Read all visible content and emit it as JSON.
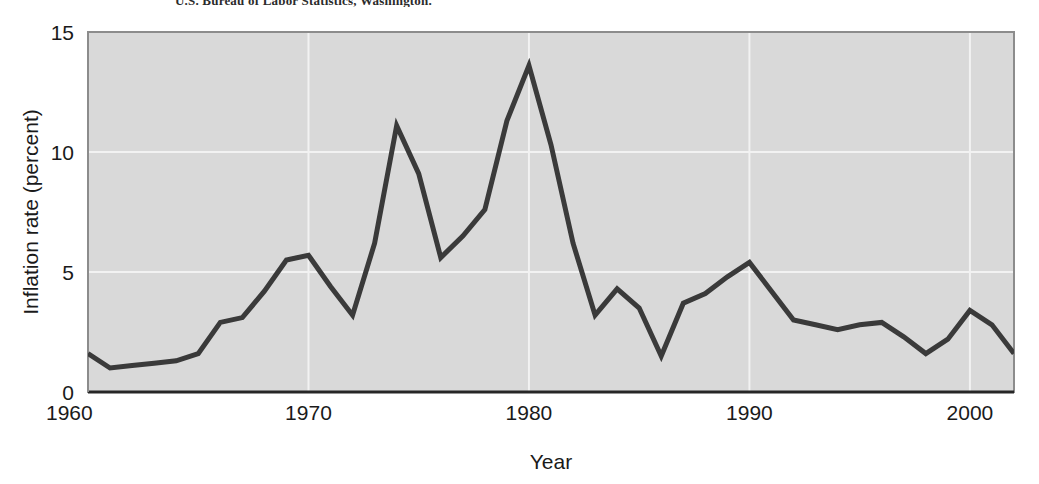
{
  "figure": {
    "source_credit": "U.S. Bureau of Labor Statistics, Washington."
  },
  "chart_data": {
    "type": "line",
    "title": "",
    "xlabel": "Year",
    "ylabel": "Inflation rate (percent)",
    "xlim": [
      1960,
      2002
    ],
    "ylim": [
      0,
      15
    ],
    "xticks": [
      1960,
      1970,
      1980,
      1990,
      2000
    ],
    "xtick_labels": [
      "1960",
      "1970",
      "1980",
      "1990",
      "2000"
    ],
    "yticks": [
      0,
      5,
      10,
      15
    ],
    "ytick_labels": [
      "0",
      "5",
      "10",
      "15"
    ],
    "grid": true,
    "grid_color": "#f2f2f2",
    "plot_background": "#d9d9d9",
    "line_color": "#3a3a3a",
    "line_width": 5,
    "legend": "none",
    "series": [
      {
        "name": "Inflation rate",
        "x": [
          1960,
          1961,
          1962,
          1963,
          1964,
          1965,
          1966,
          1967,
          1968,
          1969,
          1970,
          1971,
          1972,
          1973,
          1974,
          1975,
          1976,
          1977,
          1978,
          1979,
          1980,
          1981,
          1982,
          1983,
          1984,
          1985,
          1986,
          1987,
          1988,
          1989,
          1990,
          1991,
          1992,
          1993,
          1994,
          1995,
          1996,
          1997,
          1998,
          1999,
          2000,
          2001,
          2002
        ],
        "values": [
          1.6,
          1.0,
          1.1,
          1.2,
          1.3,
          1.6,
          2.9,
          3.1,
          4.2,
          5.5,
          5.7,
          4.4,
          3.2,
          6.2,
          11.1,
          9.1,
          5.6,
          6.5,
          7.6,
          11.3,
          13.6,
          10.3,
          6.2,
          3.2,
          4.3,
          3.5,
          1.5,
          3.7,
          4.1,
          4.8,
          5.4,
          4.2,
          3.0,
          2.8,
          2.6,
          2.8,
          2.9,
          2.3,
          1.6,
          2.2,
          3.4,
          2.8,
          1.6
        ]
      }
    ]
  },
  "plot_geometry": {
    "left": 88,
    "top": 32,
    "right": 1014,
    "bottom": 392
  }
}
